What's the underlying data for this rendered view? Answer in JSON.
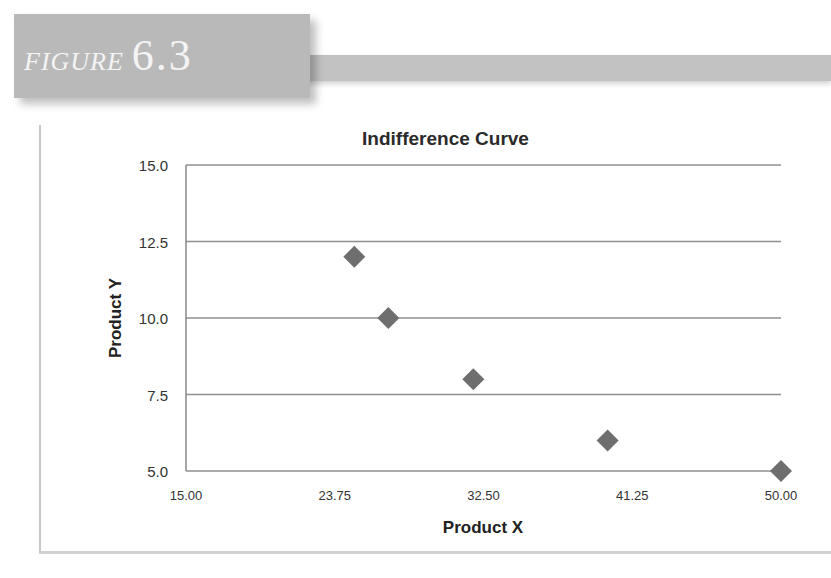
{
  "figure": {
    "word": "FIGURE",
    "number": "6.3"
  },
  "chart_data": {
    "type": "scatter",
    "title": "Indifference Curve",
    "xlabel": "Product X",
    "ylabel": "Product Y",
    "xlim": [
      15,
      50
    ],
    "ylim": [
      5,
      15
    ],
    "x_ticks": [
      "15.00",
      "23.75",
      "32.50",
      "41.25",
      "50.00"
    ],
    "y_ticks": [
      "15.0",
      "12.5",
      "10.0",
      "7.5",
      "5.0"
    ],
    "grid": "horizontal",
    "legend": "none",
    "marker": "diamond",
    "marker_color": "#6e6e6e",
    "series": [
      {
        "name": "Indifference Curve",
        "points": [
          {
            "x": 24.9,
            "y": 12
          },
          {
            "x": 26.9,
            "y": 10
          },
          {
            "x": 31.9,
            "y": 8
          },
          {
            "x": 39.8,
            "y": 6
          },
          {
            "x": 50.0,
            "y": 5
          }
        ]
      }
    ]
  }
}
